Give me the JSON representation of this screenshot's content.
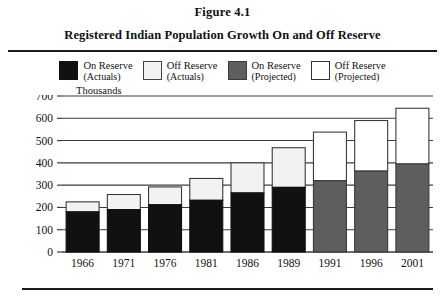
{
  "figure": {
    "number": "Figure 4.1",
    "title": "Registered Indian Population Growth On and Off Reserve"
  },
  "legend": [
    {
      "label_line1": "On Reserve",
      "label_line2": "(Actuals)",
      "swatch": "black",
      "color": "#111111"
    },
    {
      "label_line1": "Off Reserve",
      "label_line2": "(Actuals)",
      "swatch": "white-actual",
      "color": "#f2f2f0"
    },
    {
      "label_line1": "On Reserve",
      "label_line2": "(Projected)",
      "swatch": "gray",
      "color": "#5e5e5e"
    },
    {
      "label_line1": "Off Reserve",
      "label_line2": "(Projected)",
      "swatch": "white-projected",
      "color": "#ffffff"
    }
  ],
  "axis": {
    "units_label": "Thousands",
    "y_ticks": [
      "700",
      "600",
      "500",
      "400",
      "300",
      "200",
      "100",
      "0"
    ]
  },
  "chart_data": {
    "type": "bar",
    "stacked": true,
    "title": "Registered Indian Population Growth On and Off Reserve",
    "xlabel": "",
    "ylabel": "Thousands",
    "ylim": [
      0,
      700
    ],
    "ytick_step": 100,
    "grid": true,
    "legend_position": "top",
    "categories": [
      "1966",
      "1971",
      "1976",
      "1981",
      "1986",
      "1989",
      "1991",
      "1996",
      "2001"
    ],
    "status": [
      "actual",
      "actual",
      "actual",
      "actual",
      "actual",
      "actual",
      "projected",
      "projected",
      "projected"
    ],
    "series": [
      {
        "name": "On Reserve",
        "values": [
          180,
          190,
          212,
          232,
          265,
          290,
          320,
          363,
          395
        ]
      },
      {
        "name": "Off Reserve",
        "values": [
          45,
          68,
          80,
          98,
          135,
          178,
          218,
          227,
          250
        ]
      }
    ],
    "totals": [
      225,
      258,
      292,
      330,
      400,
      468,
      538,
      590,
      645
    ]
  }
}
